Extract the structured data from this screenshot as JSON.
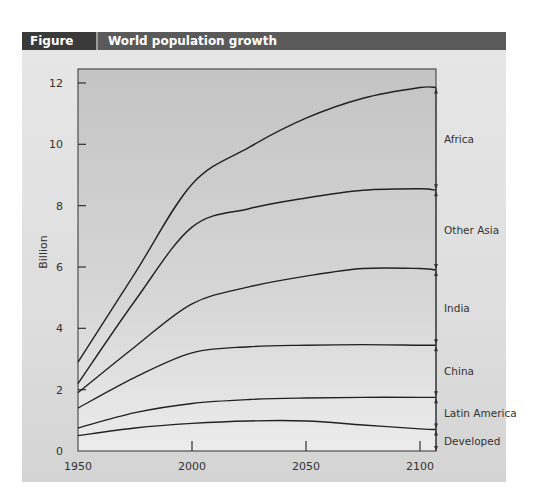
{
  "header": {
    "figure_number": "Figure 3.2",
    "title": "World population growth"
  },
  "colors": {
    "header_dark": "#3a3a3a",
    "header_bar": "#5a5a5a",
    "panel_bg": "#dedede",
    "plot_bg": "#c9c9c9",
    "line": "#222222"
  },
  "chart_data": {
    "type": "area",
    "stacked": true,
    "title": "World population growth",
    "xlabel": "",
    "ylabel": "Billion",
    "xlim": [
      1950,
      2107
    ],
    "ylim": [
      0,
      12.6
    ],
    "x_ticks": [
      1950,
      2000,
      2050,
      2100
    ],
    "y_ticks": [
      0,
      2,
      4,
      6,
      8,
      10,
      12
    ],
    "grid": false,
    "legend_position": "right, inline labels with bracket arrows",
    "x": [
      1950,
      1975,
      2000,
      2025,
      2050,
      2075,
      2100,
      2107
    ],
    "series_cumulative_top": [
      {
        "name": "Developed",
        "values": [
          0.5,
          0.75,
          0.9,
          0.98,
          0.98,
          0.85,
          0.72,
          0.7
        ]
      },
      {
        "name": "Latin America",
        "values": [
          0.75,
          1.25,
          1.55,
          1.68,
          1.73,
          1.75,
          1.75,
          1.75
        ]
      },
      {
        "name": "China",
        "values": [
          1.4,
          2.4,
          3.2,
          3.4,
          3.45,
          3.47,
          3.45,
          3.45
        ]
      },
      {
        "name": "India",
        "values": [
          1.9,
          3.4,
          4.8,
          5.35,
          5.7,
          5.95,
          5.95,
          5.9
        ]
      },
      {
        "name": "Other Asia",
        "values": [
          2.2,
          4.9,
          7.3,
          7.9,
          8.25,
          8.5,
          8.55,
          8.5
        ]
      },
      {
        "name": "Africa",
        "values": [
          2.9,
          5.8,
          8.7,
          9.9,
          10.85,
          11.5,
          11.85,
          11.85
        ]
      }
    ],
    "labels": [
      "Africa",
      "Other Asia",
      "India",
      "China",
      "Latin America",
      "Developed"
    ]
  }
}
